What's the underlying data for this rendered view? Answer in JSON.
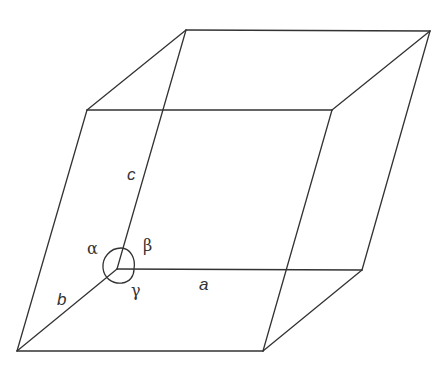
{
  "diagram": {
    "type": "unit-cell-parallelepiped",
    "stroke_color": "#333333",
    "background": "#ffffff",
    "labels": {
      "a": "a",
      "b": "b",
      "c": "c",
      "alpha": "α",
      "beta": "β",
      "gamma": "γ"
    },
    "vertices": {
      "origin": [
        117,
        269
      ],
      "a_end": [
        362,
        270
      ],
      "b_end": [
        17,
        351
      ],
      "c_end": [
        186,
        30
      ],
      "ab": [
        263,
        351
      ],
      "ac": [
        430,
        31
      ],
      "bc": [
        87,
        110
      ],
      "abc": [
        332,
        110
      ]
    }
  }
}
